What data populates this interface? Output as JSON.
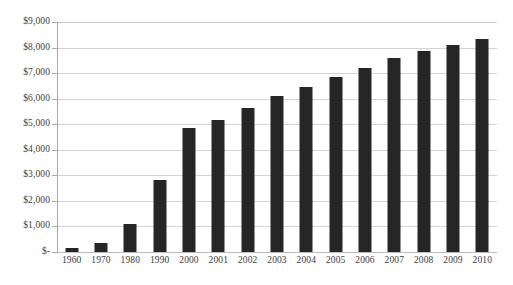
{
  "chart_data": {
    "type": "bar",
    "title": "",
    "subtitle": "",
    "xlabel": "",
    "ylabel": "",
    "legend": [],
    "legend_position": "none",
    "grid": true,
    "grid_axis": "y",
    "ylim": [
      0,
      9000
    ],
    "ytick_step": 1000,
    "categories": [
      "1960",
      "1970",
      "1980",
      "1990",
      "2000",
      "2001",
      "2002",
      "2003",
      "2004",
      "2005",
      "2006",
      "2007",
      "2008",
      "2009",
      "2010"
    ],
    "values": [
      150,
      350,
      1090,
      2830,
      4850,
      5180,
      5640,
      6100,
      6460,
      6830,
      7210,
      7590,
      7870,
      8120,
      8350
    ],
    "ytick_labels": [
      "$9,000",
      "$8,000",
      "$7,000",
      "$6,000",
      "$5,000",
      "$4,000",
      "$3,000",
      "$2,000",
      "$1,000",
      "$-"
    ],
    "ytick_values": [
      9000,
      8000,
      7000,
      6000,
      5000,
      4000,
      3000,
      2000,
      1000,
      0
    ],
    "bar_color": "#262626",
    "gridline_color": "#d4d4d4",
    "axis_color": "#a8a8a8",
    "text_color": "#3d3d3d",
    "background_color": "#ffffff"
  }
}
